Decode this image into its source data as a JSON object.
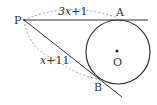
{
  "diagram": {
    "points": {
      "P": {
        "label": "P"
      },
      "A": {
        "label": "A"
      },
      "B": {
        "label": "B"
      },
      "O": {
        "label": "O"
      }
    },
    "lengths": {
      "PA": {
        "var": "3x",
        "rest": "+1"
      },
      "PB": {
        "var": "x",
        "rest": "+11"
      }
    },
    "colors": {
      "stroke": "#333333",
      "dashed": "#888888"
    }
  }
}
